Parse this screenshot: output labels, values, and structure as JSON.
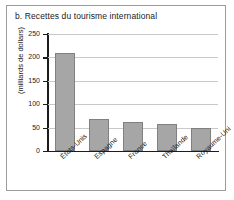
{
  "figure": {
    "title": "b. Recettes du tourisme international"
  },
  "chart_data": {
    "type": "bar",
    "title": "b. Recettes du tourisme international",
    "xlabel": "",
    "ylabel": "(milliards de dollars)",
    "ylim": [
      0,
      250
    ],
    "yticks": [
      0,
      50,
      100,
      150,
      200,
      250
    ],
    "ytick_labels": [
      "0",
      "50",
      "100",
      "150",
      "200",
      "250"
    ],
    "grid": true,
    "legend": null,
    "categories": [
      "États-Unis",
      "Espagne",
      "France",
      "Thaïlande",
      "Royaume-Uni"
    ],
    "values": [
      210,
      68,
      62,
      57,
      50
    ],
    "bar_color": "#a6a6a6",
    "bar_edge_color": "#808080"
  }
}
